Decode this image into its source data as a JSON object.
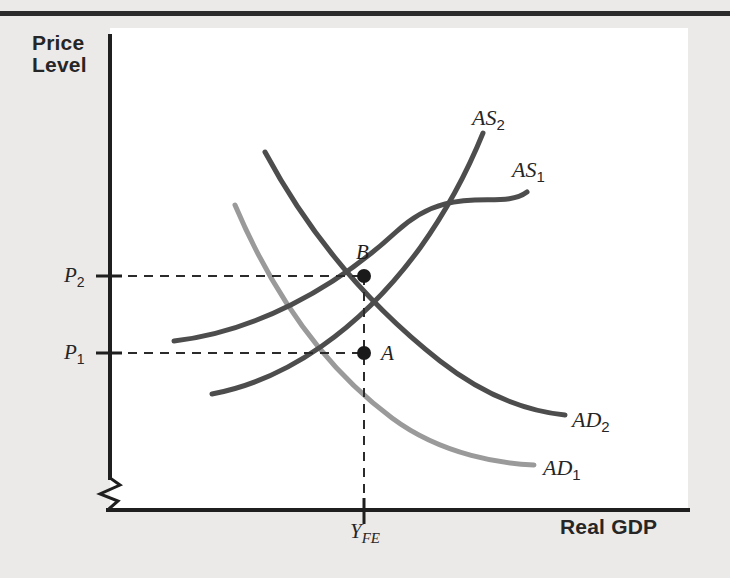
{
  "figure": {
    "type": "economics-as-ad-diagram",
    "background_color": "#eceae8",
    "plot_background_color": "#ffffff",
    "top_rule_color": "#262626"
  },
  "axes": {
    "y_axis": {
      "title_line1": "Price",
      "title_line2": "Level",
      "has_break_symbol": true,
      "break_symbol": "zigzag",
      "color": "#1f1f1f",
      "ticks": [
        {
          "label": "P",
          "sub": "2",
          "value_y_px": 276
        },
        {
          "label": "P",
          "sub": "1",
          "value_y_px": 353
        }
      ]
    },
    "x_axis": {
      "title": "Real GDP",
      "color": "#1f1f1f",
      "ticks": [
        {
          "label": "Y",
          "sub": "FE",
          "value_x_px": 364
        }
      ]
    }
  },
  "curves": [
    {
      "name": "AS2",
      "label": "AS",
      "sub": "2",
      "kind": "aggregate-supply",
      "color": "#4d4d4d",
      "path": "M 212 394 C 286 380 360 330 420 248 C 450 206 470 165 483 133"
    },
    {
      "name": "AS1",
      "label": "AS",
      "sub": "1",
      "kind": "aggregate-supply",
      "color": "#4d4d4d",
      "path": "M 174 341 C 254 332 334 289 396 232 C 452 180 500 212 527 192"
    },
    {
      "name": "AD2",
      "label": "AD",
      "sub": "2",
      "kind": "aggregate-demand",
      "color": "#4d4d4d",
      "path": "M 265 152 C 310 236 370 306 440 361 C 490 400 535 412 565 415"
    },
    {
      "name": "AD1",
      "label": "AD",
      "sub": "1",
      "kind": "aggregate-demand",
      "color": "#9a9a9a",
      "path": "M 235 205 C 272 292 322 366 392 418 C 443 456 505 464 534 465"
    }
  ],
  "equilibria": [
    {
      "label": "A",
      "x_px": 364,
      "y_px": 353,
      "price_level": "P1",
      "output": "YFE"
    },
    {
      "label": "B",
      "x_px": 364,
      "y_px": 276,
      "price_level": "P2",
      "output": "YFE"
    }
  ],
  "guides": {
    "dashed_color": "#2b2b2b",
    "horizontal": [
      {
        "from": "P2-tick",
        "to": "point-B",
        "y_px": 276
      },
      {
        "from": "P1-tick",
        "to": "point-A",
        "y_px": 353
      }
    ],
    "vertical": [
      {
        "from": "point-B",
        "to": "YFE-tick",
        "x_px": 364
      }
    ]
  }
}
